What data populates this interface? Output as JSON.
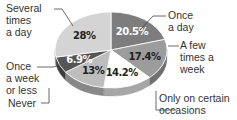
{
  "chart_data": {
    "type": "pie",
    "title": "",
    "start_angle": "12 o'clock",
    "direction": "clockwise",
    "categories": [
      "Once a day",
      "A few times a week",
      "Only on certain occasions",
      "Never",
      "Once a week or less",
      "Several times a day"
    ],
    "values": [
      20.5,
      17.4,
      14.2,
      13,
      6.9,
      28
    ],
    "value_labels": [
      "20.5%",
      "17.4%",
      "14.2%",
      "13%",
      "6.9%",
      "28%"
    ],
    "colors": [
      "#7d7d7d",
      "#9c9c9c",
      "#ffffff",
      "#bdbdbd",
      "#555555",
      "#d4d4d4"
    ],
    "label_colors": [
      "#ffffff",
      "#222222",
      "#222222",
      "#222222",
      "#ffffff",
      "#222222"
    ],
    "style": "3d-tilted",
    "legend": "callout labels"
  },
  "labels": {
    "once_a_day": [
      "Once",
      "a day"
    ],
    "few_times_week": [
      "A few",
      "times a",
      "week"
    ],
    "certain_occasions": [
      "Only on certain",
      "occasions"
    ],
    "never": [
      "Never"
    ],
    "once_week_or_less": [
      "Once",
      "a week",
      "or less"
    ],
    "several_times_day": [
      "Several",
      "times",
      "a day"
    ]
  }
}
